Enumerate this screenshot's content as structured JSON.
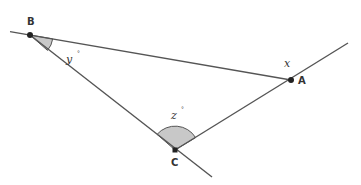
{
  "diagram": {
    "type": "geometry-triangle",
    "colors": {
      "line": "#555555",
      "point": "#222222",
      "angle_fill": "#c8c8c8",
      "label": "#333333"
    },
    "points": [
      {
        "id": "B",
        "label": "B",
        "x": 30,
        "y": 35
      },
      {
        "id": "A",
        "label": "A",
        "x": 291,
        "y": 80
      },
      {
        "id": "C",
        "label": "C",
        "x": 175,
        "y": 150
      }
    ],
    "angles": [
      {
        "id": "y",
        "label": "y",
        "degree_mark": "°",
        "vertex": "B",
        "shaded": true
      },
      {
        "id": "z",
        "label": "z",
        "degree_mark": "°",
        "vertex": "C",
        "shaded": true
      },
      {
        "id": "x",
        "label": "x",
        "degree_mark": "",
        "vertex": "A",
        "shaded": false
      }
    ]
  }
}
